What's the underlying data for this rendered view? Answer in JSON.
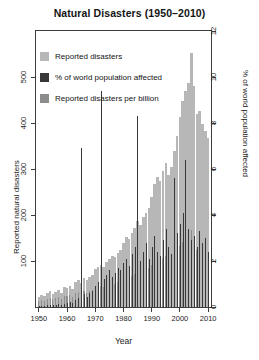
{
  "chart_data": {
    "type": "bar",
    "title": "Natural Disasters (1950–2010)",
    "xlabel": "Year",
    "ylabel": "Reported natural disasters",
    "y2label": "% of world population affected",
    "xlim": [
      1949,
      2011
    ],
    "ylim": [
      0,
      600
    ],
    "y2lim": [
      0,
      12
    ],
    "grid": false,
    "legend_position": "top-left-inside",
    "xticks": [
      1950,
      1960,
      1970,
      1980,
      1990,
      2000,
      2010
    ],
    "yticks": [
      100,
      200,
      300,
      400,
      500
    ],
    "y2ticks": [
      0,
      2,
      4,
      6,
      8,
      10,
      12
    ],
    "legend": [
      {
        "label": "Reported disasters",
        "color": "#b7b7b7"
      },
      {
        "label": "% of world population affected",
        "color": "#383838"
      },
      {
        "label": "Reported disasters per billion",
        "color": "#8c8c8c"
      }
    ],
    "x": [
      1950,
      1951,
      1952,
      1953,
      1954,
      1955,
      1956,
      1957,
      1958,
      1959,
      1960,
      1961,
      1962,
      1963,
      1964,
      1965,
      1966,
      1967,
      1968,
      1969,
      1970,
      1971,
      1972,
      1973,
      1974,
      1975,
      1976,
      1977,
      1978,
      1979,
      1980,
      1981,
      1982,
      1983,
      1984,
      1985,
      1986,
      1987,
      1988,
      1989,
      1990,
      1991,
      1992,
      1993,
      1994,
      1995,
      1996,
      1997,
      1998,
      1999,
      2000,
      2001,
      2002,
      2003,
      2004,
      2005,
      2006,
      2007,
      2008,
      2009,
      2010
    ],
    "series": [
      {
        "name": "Reported disasters",
        "axis": "left",
        "color": "#b7b7b7",
        "values": [
          22,
          26,
          24,
          30,
          34,
          28,
          32,
          38,
          30,
          44,
          42,
          46,
          40,
          54,
          58,
          52,
          62,
          58,
          66,
          70,
          82,
          88,
          92,
          86,
          98,
          104,
          110,
          108,
          118,
          124,
          140,
          152,
          148,
          160,
          172,
          186,
          178,
          196,
          204,
          216,
          240,
          268,
          282,
          274,
          296,
          312,
          288,
          304,
          340,
          372,
          412,
          448,
          470,
          486,
          552,
          480,
          420,
          426,
          398,
          382,
          368
        ]
      },
      {
        "name": "Reported disasters per billion",
        "axis": "left",
        "color": "#8c8c8c",
        "values": [
          14,
          16,
          14,
          18,
          20,
          17,
          19,
          22,
          18,
          25,
          24,
          26,
          22,
          30,
          32,
          28,
          34,
          31,
          35,
          37,
          42,
          45,
          46,
          43,
          48,
          50,
          52,
          50,
          54,
          56,
          62,
          66,
          64,
          68,
          72,
          76,
          72,
          78,
          80,
          84,
          92,
          100,
          104,
          100,
          106,
          110,
          100,
          104,
          114,
          122,
          132,
          142,
          146,
          150,
          168,
          144,
          124,
          124,
          114,
          108,
          102
        ]
      },
      {
        "name": "% of world population affected",
        "axis": "right",
        "color": "#383838",
        "values": [
          0.05,
          0.06,
          0.05,
          0.08,
          0.1,
          0.07,
          0.09,
          0.12,
          0.08,
          0.14,
          0.18,
          0.22,
          0.16,
          0.3,
          0.4,
          6.9,
          0.55,
          0.45,
          0.62,
          0.7,
          0.9,
          1.1,
          9.4,
          1.2,
          1.4,
          1.6,
          1.3,
          1.5,
          1.7,
          1.6,
          1.9,
          2.1,
          1.8,
          2.3,
          2.6,
          8.3,
          2.0,
          2.4,
          2.8,
          2.1,
          2.6,
          3.1,
          2.4,
          2.2,
          2.9,
          3.4,
          2.6,
          2.3,
          5.6,
          3.2,
          3.6,
          4.1,
          6.4,
          3.4,
          2.9,
          3.1,
          2.6,
          3.3,
          2.8,
          3.0,
          2.4
        ]
      }
    ]
  }
}
